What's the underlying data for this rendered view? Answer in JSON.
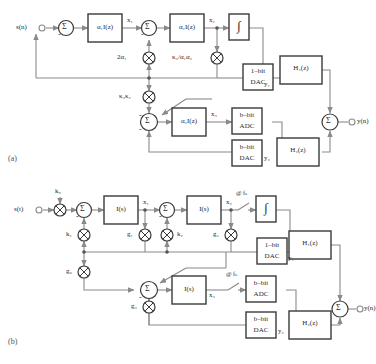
{
  "figure": {
    "type": "block-diagram",
    "panels": [
      {
        "id": "a",
        "caption": "(a)",
        "input_label": "s(n)",
        "output_label": "y(n)",
        "blocks": [
          {
            "name": "integrator-1",
            "text": "α₁I(z)"
          },
          {
            "name": "integrator-2",
            "text": "α₂I(z)"
          },
          {
            "name": "integrator-3",
            "text": "α₃I(z)"
          },
          {
            "name": "quantizer-1bit",
            "text": "∫"
          },
          {
            "name": "dac-1bit",
            "line1": "1–bit",
            "line2": "DAC"
          },
          {
            "name": "adc-bbit",
            "line1": "b–bit",
            "line2": "ADC"
          },
          {
            "name": "dac-bbit",
            "line1": "b–bit",
            "line2": "DAC"
          },
          {
            "name": "filter-h1",
            "text": "H₁(z)"
          },
          {
            "name": "filter-h2",
            "text": "H₂(z)"
          }
        ],
        "gains": [
          {
            "name": "gain-2alpha1",
            "text": "2α₁"
          },
          {
            "name": "gain-kappa2-over-alpha1alpha2",
            "text": "κ₂/α₁α₂"
          },
          {
            "name": "gain-kappa3kappa2",
            "text": "κ₃κ₂"
          }
        ],
        "signals": [
          {
            "name": "signal-x1",
            "text": "x₁"
          },
          {
            "name": "signal-x2",
            "text": "x₂"
          },
          {
            "name": "signal-x3",
            "text": "x₃"
          },
          {
            "name": "signal-y1",
            "text": "y₁"
          },
          {
            "name": "signal-y2",
            "text": "y₂"
          }
        ],
        "summer_symbol": "Σ",
        "minus_symbol": "-"
      },
      {
        "id": "b",
        "caption": "(b)",
        "input_label": "s(t)",
        "output_label": "y(n)",
        "blocks": [
          {
            "name": "integrator-1",
            "text": "I(s)"
          },
          {
            "name": "integrator-2",
            "text": "I(s)"
          },
          {
            "name": "integrator-3",
            "text": "I(s)"
          },
          {
            "name": "quantizer-1bit",
            "text": "∫"
          },
          {
            "name": "dac-1bit",
            "line1": "1–bit",
            "line2": "DAC"
          },
          {
            "name": "adc-bbit",
            "line1": "b–bit",
            "line2": "ADC"
          },
          {
            "name": "dac-bbit",
            "line1": "b–bit",
            "line2": "DAC"
          },
          {
            "name": "filter-h1",
            "text": "H₁(z)"
          },
          {
            "name": "filter-h2",
            "text": "H₂(z)"
          }
        ],
        "gains": [
          {
            "name": "gain-k0",
            "text": "k₀"
          },
          {
            "name": "gain-k1",
            "text": "k₁"
          },
          {
            "name": "gain-k2",
            "text": "k₂"
          },
          {
            "name": "gain-g0",
            "text": "g₀"
          },
          {
            "name": "gain-g1",
            "text": "g₁"
          },
          {
            "name": "gain-g2",
            "text": "g₂"
          },
          {
            "name": "gain-g3",
            "text": "g₃"
          }
        ],
        "signals": [
          {
            "name": "signal-x1",
            "text": "x₁"
          },
          {
            "name": "signal-x2",
            "text": "x₂"
          },
          {
            "name": "signal-x3",
            "text": "x₃"
          },
          {
            "name": "signal-y1",
            "text": "y₁"
          },
          {
            "name": "signal-y2",
            "text": "y₂"
          }
        ],
        "samplers": [
          {
            "name": "sampler-top",
            "text": "@ fₛ"
          },
          {
            "name": "sampler-bottom",
            "text": "@ fₛ"
          }
        ],
        "summer_symbol": "Σ",
        "minus_symbol": "-"
      }
    ],
    "colors": {
      "line": "#8a8a8a",
      "block_border": "#3a3a3a",
      "text": "#2b2b2b",
      "background": "#ffffff"
    }
  }
}
